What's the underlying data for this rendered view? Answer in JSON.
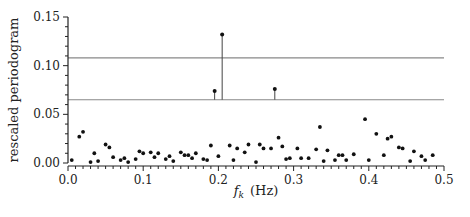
{
  "chart_data": {
    "type": "scatter",
    "title": "",
    "xlabel": "f_k (Hz)",
    "xlabel_main": "f",
    "xlabel_sub": "k",
    "xlabel_unit": "(Hz)",
    "ylabel": "rescaled periodogram",
    "xlim": [
      0.0,
      0.5
    ],
    "ylim": [
      0.0,
      0.15
    ],
    "x_ticks": [
      "0.0",
      "0.1",
      "0.2",
      "0.3",
      "0.4",
      "0.5"
    ],
    "y_ticks": [
      "0.00",
      "0.05",
      "0.10",
      "0.15"
    ],
    "grid": false,
    "legend": null,
    "thresholds": [
      0.108,
      0.065
    ],
    "stems": [
      {
        "x": 0.195,
        "y": 0.074
      },
      {
        "x": 0.205,
        "y": 0.132
      },
      {
        "x": 0.275,
        "y": 0.076
      }
    ],
    "series": [
      {
        "name": "periodogram",
        "points": [
          [
            0.005,
            0.003
          ],
          [
            0.015,
            0.027
          ],
          [
            0.02,
            0.032
          ],
          [
            0.03,
            0.001
          ],
          [
            0.035,
            0.01
          ],
          [
            0.04,
            0.002
          ],
          [
            0.05,
            0.019
          ],
          [
            0.055,
            0.016
          ],
          [
            0.06,
            0.006
          ],
          [
            0.07,
            0.003
          ],
          [
            0.075,
            0.005
          ],
          [
            0.08,
            0.001
          ],
          [
            0.09,
            0.004
          ],
          [
            0.095,
            0.012
          ],
          [
            0.1,
            0.01
          ],
          [
            0.11,
            0.011
          ],
          [
            0.115,
            0.006
          ],
          [
            0.12,
            0.01
          ],
          [
            0.13,
            0.004
          ],
          [
            0.135,
            0.007
          ],
          [
            0.14,
            0.002
          ],
          [
            0.15,
            0.011
          ],
          [
            0.155,
            0.008
          ],
          [
            0.16,
            0.008
          ],
          [
            0.165,
            0.005
          ],
          [
            0.17,
            0.01
          ],
          [
            0.18,
            0.004
          ],
          [
            0.185,
            0.003
          ],
          [
            0.19,
            0.018
          ],
          [
            0.2,
            0.007
          ],
          [
            0.215,
            0.018
          ],
          [
            0.22,
            0.003
          ],
          [
            0.225,
            0.015
          ],
          [
            0.235,
            0.011
          ],
          [
            0.24,
            0.019
          ],
          [
            0.25,
            0.001
          ],
          [
            0.255,
            0.019
          ],
          [
            0.26,
            0.015
          ],
          [
            0.27,
            0.015
          ],
          [
            0.28,
            0.026
          ],
          [
            0.285,
            0.017
          ],
          [
            0.29,
            0.004
          ],
          [
            0.295,
            0.005
          ],
          [
            0.305,
            0.015
          ],
          [
            0.31,
            0.005
          ],
          [
            0.32,
            0.005
          ],
          [
            0.33,
            0.014
          ],
          [
            0.335,
            0.037
          ],
          [
            0.34,
            0.002
          ],
          [
            0.345,
            0.013
          ],
          [
            0.355,
            0.003
          ],
          [
            0.36,
            0.008
          ],
          [
            0.365,
            0.008
          ],
          [
            0.37,
            0.003
          ],
          [
            0.38,
            0.009
          ],
          [
            0.395,
            0.045
          ],
          [
            0.4,
            0.003
          ],
          [
            0.41,
            0.03
          ],
          [
            0.42,
            0.008
          ],
          [
            0.425,
            0.025
          ],
          [
            0.43,
            0.027
          ],
          [
            0.44,
            0.016
          ],
          [
            0.445,
            0.015
          ],
          [
            0.455,
            0.002
          ],
          [
            0.46,
            0.012
          ],
          [
            0.47,
            0.007
          ],
          [
            0.475,
            0.003
          ],
          [
            0.485,
            0.008
          ]
        ]
      }
    ]
  }
}
